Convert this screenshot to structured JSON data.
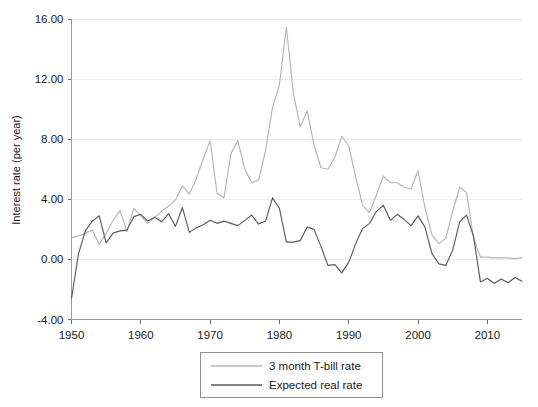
{
  "chart_data": {
    "type": "line",
    "title": "",
    "xlabel": "",
    "ylabel": "Interest rate (per year)",
    "xlim": [
      1950,
      2015
    ],
    "ylim": [
      -4.0,
      16.0
    ],
    "grid": true,
    "legend_position": "below-center",
    "xticks": [
      "1950",
      "1960",
      "1970",
      "1980",
      "1990",
      "2000",
      "2010"
    ],
    "xtick_values": [
      1950,
      1960,
      1970,
      1980,
      1990,
      2000,
      2010
    ],
    "yticks": [
      "-4.00",
      "0.00",
      "4.00",
      "8.00",
      "12.00",
      "16.00"
    ],
    "ytick_values": [
      -4.0,
      0.0,
      4.0,
      8.0,
      12.0,
      16.0
    ],
    "x": [
      1950,
      1951,
      1952,
      1953,
      1954,
      1955,
      1956,
      1957,
      1958,
      1959,
      1960,
      1961,
      1962,
      1963,
      1964,
      1965,
      1966,
      1967,
      1968,
      1969,
      1970,
      1971,
      1972,
      1973,
      1974,
      1975,
      1976,
      1977,
      1978,
      1979,
      1980,
      1981,
      1982,
      1983,
      1984,
      1985,
      1986,
      1987,
      1988,
      1989,
      1990,
      1991,
      1992,
      1993,
      1994,
      1995,
      1996,
      1997,
      1998,
      1999,
      2000,
      2001,
      2002,
      2003,
      2004,
      2005,
      2006,
      2007,
      2008,
      2009,
      2010,
      2011,
      2012,
      2013,
      2014,
      2015
    ],
    "series": [
      {
        "name": "3 month T-bill rate",
        "color": "#b5b5b5",
        "values": [
          1.45,
          1.55,
          1.75,
          1.95,
          1.0,
          1.75,
          2.6,
          3.25,
          1.85,
          3.4,
          2.9,
          2.4,
          2.8,
          3.2,
          3.55,
          3.95,
          4.9,
          4.35,
          5.35,
          6.7,
          7.9,
          4.4,
          4.1,
          7.05,
          7.9,
          6.0,
          5.1,
          5.3,
          7.25,
          10.1,
          11.6,
          15.45,
          11.1,
          8.8,
          9.9,
          7.6,
          6.1,
          6.0,
          6.8,
          8.2,
          7.55,
          5.5,
          3.6,
          3.1,
          4.3,
          5.55,
          5.1,
          5.1,
          4.8,
          4.7,
          5.9,
          3.45,
          1.65,
          1.05,
          1.4,
          3.2,
          4.8,
          4.45,
          1.45,
          0.15,
          0.15,
          0.1,
          0.1,
          0.1,
          0.05,
          0.1
        ]
      },
      {
        "name": "Expected real rate",
        "color": "#5a5a5a",
        "values": [
          -2.6,
          0.35,
          1.9,
          2.55,
          2.9,
          1.1,
          1.75,
          1.9,
          1.95,
          2.85,
          3.0,
          2.55,
          2.8,
          2.5,
          3.05,
          2.2,
          3.45,
          1.8,
          2.1,
          2.3,
          2.6,
          2.4,
          2.55,
          2.4,
          2.25,
          2.6,
          2.95,
          2.35,
          2.55,
          4.1,
          3.4,
          1.15,
          1.15,
          1.25,
          2.15,
          2.0,
          0.85,
          -0.4,
          -0.35,
          -0.9,
          -0.2,
          1.05,
          2.05,
          2.4,
          3.2,
          3.6,
          2.6,
          3.0,
          2.65,
          2.25,
          2.9,
          2.15,
          0.4,
          -0.3,
          -0.4,
          0.6,
          2.5,
          2.95,
          1.55,
          -1.5,
          -1.25,
          -1.6,
          -1.3,
          -1.55,
          -1.2,
          -1.45
        ]
      }
    ]
  },
  "axes": {
    "y_axis_title": "Interest rate (per year)"
  },
  "legend": {
    "entries": [
      {
        "label": "3 month T-bill rate",
        "color": "#b5b5b5"
      },
      {
        "label": "Expected real rate",
        "color": "#5a5a5a"
      }
    ]
  }
}
